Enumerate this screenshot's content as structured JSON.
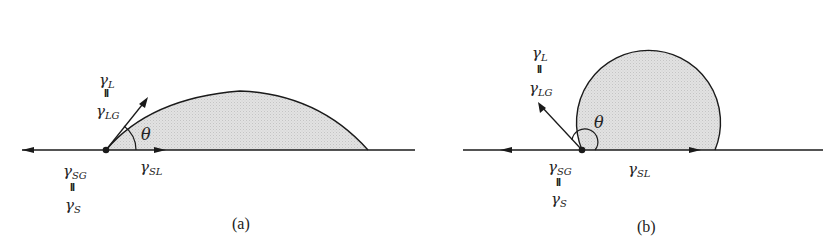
{
  "figure": {
    "panels": [
      {
        "id": "a",
        "caption": "(a)",
        "angle_label": "θ",
        "gamma": "γ",
        "liquid_label": {
          "top_sub": "L",
          "equals": "II",
          "bottom_sub": "LG"
        },
        "solid_gas_label": {
          "top_sub": "SG",
          "equals": "II",
          "bottom_sub": "S"
        },
        "solid_liquid_label": {
          "sub": "SL"
        },
        "contact_angle_type": "acute"
      },
      {
        "id": "b",
        "caption": "(b)",
        "angle_label": "θ",
        "gamma": "γ",
        "liquid_label": {
          "top_sub": "L",
          "equals": "II",
          "bottom_sub": "LG"
        },
        "solid_gas_label": {
          "top_sub": "SG",
          "equals": "II",
          "bottom_sub": "S"
        },
        "solid_liquid_label": {
          "sub": "SL"
        },
        "contact_angle_type": "obtuse"
      }
    ],
    "colors": {
      "line": "#1a1a1a",
      "droplet_fill": "#d9d9d9",
      "background": "#ffffff"
    }
  }
}
